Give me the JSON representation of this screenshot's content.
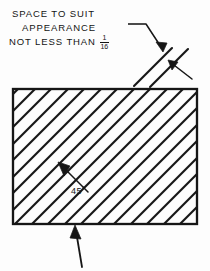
{
  "figure": {
    "kind": "engineering-drawing-annotation",
    "background_color": "#fdfdfd",
    "ink_color": "#141414"
  },
  "note": {
    "line1": "SPACE TO SUIT",
    "line2": "APPEARANCE",
    "line3": "NOT LESS THAN",
    "fraction_numerator": "1",
    "fraction_denominator": "16"
  },
  "angle_callout": {
    "label": "45",
    "degree_symbol": "°"
  },
  "geometry": {
    "rectangle": {
      "x": 13,
      "y": 89,
      "width": 184,
      "height": 135
    },
    "hatch_angle_degrees": 45,
    "hatch_spacing_px": 16.5,
    "spacing_sample_lines": 2,
    "leader_from_note_to_spacing": true,
    "leader_from_spacing_to_lower_right": true,
    "leader_from_angle_label": true,
    "bottom_pointer_arrow": true
  }
}
